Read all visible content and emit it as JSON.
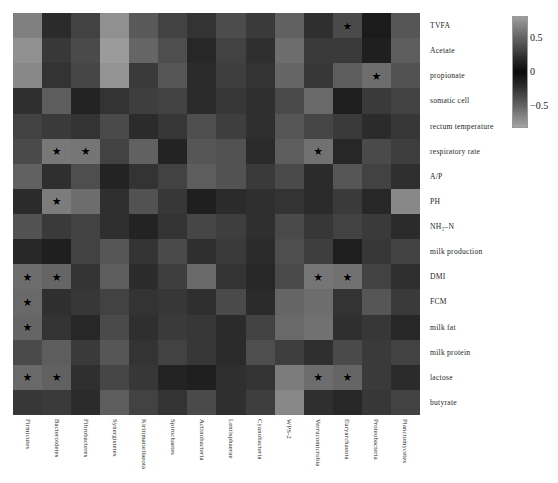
{
  "chart_data": {
    "type": "heatmap",
    "title": "",
    "xlabel": "",
    "ylabel": "",
    "grid": false,
    "colormap": "grayscale-diverging",
    "colorbar": {
      "position": "right",
      "ticks": [
        0.5,
        0,
        -0.5
      ],
      "tick_labels": [
        "0.5",
        "0",
        "−0.5"
      ],
      "vmin": -0.8,
      "vmax": 0.8
    },
    "significance_marker": "★",
    "columns": [
      "Firmicutes",
      "Bacteroidetes",
      "Fibrobacteres",
      "Synergistetes",
      "Kiritimatiellaeota",
      "Spirochaetes",
      "Actinobacteria",
      "Lentisphaerae",
      "Cyanobacteria",
      "WPS-2",
      "Verrucomicrobia",
      "Euryarchaeota",
      "Proteobacteria",
      "Planctomycetes"
    ],
    "rows": [
      "TVFA",
      "Acetate",
      "propionate",
      "somatic cell",
      "rectum temperature",
      "respiratory rate",
      "A/P",
      "PH",
      "NH₃–N",
      "milk production",
      "DMI",
      "FCM",
      "milk fat",
      "milk protein",
      "lactose",
      "butyrate"
    ],
    "values": [
      [
        -0.62,
        -0.18,
        -0.3,
        -0.7,
        -0.42,
        0.3,
        -0.22,
        -0.35,
        -0.26,
        -0.46,
        -0.2,
        0.34,
        -0.1,
        -0.4
      ],
      [
        -0.7,
        -0.25,
        -0.34,
        -0.76,
        -0.48,
        0.36,
        -0.16,
        -0.3,
        -0.2,
        -0.52,
        -0.26,
        0.26,
        0.12,
        -0.44
      ],
      [
        -0.66,
        -0.22,
        -0.32,
        -0.72,
        -0.26,
        0.4,
        -0.18,
        -0.28,
        -0.22,
        -0.48,
        -0.24,
        0.44,
        0.52,
        -0.38
      ],
      [
        -0.2,
        -0.44,
        -0.14,
        0.22,
        -0.28,
        -0.3,
        -0.18,
        -0.24,
        -0.2,
        -0.34,
        -0.5,
        -0.12,
        -0.26,
        -0.3
      ],
      [
        -0.3,
        -0.26,
        -0.22,
        -0.34,
        -0.18,
        -0.24,
        -0.36,
        -0.28,
        -0.2,
        -0.4,
        -0.32,
        -0.26,
        -0.18,
        -0.24
      ],
      [
        0.34,
        0.58,
        0.56,
        -0.3,
        0.46,
        0.14,
        -0.4,
        -0.38,
        0.18,
        -0.44,
        0.54,
        0.16,
        -0.34,
        0.28
      ],
      [
        -0.46,
        -0.2,
        -0.36,
        0.14,
        -0.22,
        -0.3,
        -0.44,
        -0.38,
        -0.26,
        -0.34,
        -0.18,
        -0.4,
        -0.3,
        0.2
      ],
      [
        0.18,
        0.6,
        -0.52,
        -0.2,
        0.38,
        0.24,
        0.12,
        -0.18,
        0.2,
        0.22,
        0.18,
        0.26,
        0.16,
        -0.66
      ],
      [
        -0.38,
        -0.26,
        -0.3,
        0.2,
        0.14,
        -0.22,
        -0.32,
        -0.28,
        -0.2,
        -0.34,
        -0.24,
        -0.3,
        -0.26,
        -0.18
      ],
      [
        -0.16,
        -0.12,
        -0.3,
        -0.4,
        -0.22,
        -0.34,
        -0.2,
        -0.26,
        -0.18,
        -0.36,
        -0.28,
        0.12,
        -0.24,
        -0.3
      ],
      [
        0.52,
        0.48,
        0.22,
        -0.44,
        0.18,
        -0.28,
        -0.5,
        -0.22,
        0.16,
        -0.34,
        0.56,
        0.54,
        -0.3,
        -0.2
      ],
      [
        0.5,
        0.2,
        0.24,
        -0.3,
        0.22,
        -0.24,
        -0.2,
        -0.34,
        -0.18,
        -0.48,
        0.52,
        -0.22,
        -0.4,
        -0.26
      ],
      [
        0.48,
        0.22,
        0.16,
        -0.34,
        -0.2,
        -0.26,
        0.24,
        -0.18,
        -0.3,
        -0.5,
        0.54,
        -0.2,
        -0.24,
        -0.16
      ],
      [
        -0.34,
        -0.44,
        -0.26,
        -0.4,
        -0.22,
        -0.3,
        -0.24,
        -0.18,
        -0.36,
        -0.28,
        -0.2,
        -0.34,
        -0.26,
        -0.3
      ],
      [
        0.5,
        0.46,
        0.2,
        -0.32,
        0.24,
        0.14,
        0.12,
        -0.2,
        0.22,
        -0.6,
        0.52,
        0.48,
        -0.26,
        -0.18
      ],
      [
        0.24,
        -0.26,
        -0.18,
        -0.44,
        -0.3,
        -0.22,
        -0.34,
        -0.2,
        -0.28,
        -0.66,
        0.2,
        0.16,
        -0.24,
        -0.3
      ]
    ],
    "significant_cells": [
      [
        0,
        11
      ],
      [
        2,
        12
      ],
      [
        5,
        1
      ],
      [
        5,
        2
      ],
      [
        5,
        10
      ],
      [
        7,
        1
      ],
      [
        10,
        0
      ],
      [
        10,
        1
      ],
      [
        10,
        10
      ],
      [
        10,
        11
      ],
      [
        11,
        0
      ],
      [
        12,
        0
      ],
      [
        14,
        0
      ],
      [
        14,
        1
      ],
      [
        14,
        10
      ],
      [
        14,
        11
      ]
    ]
  }
}
